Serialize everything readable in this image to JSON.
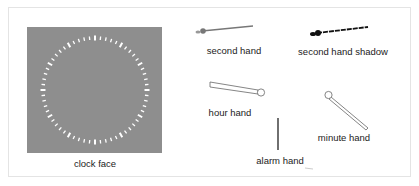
{
  "diagram": {
    "title": "",
    "components": [
      {
        "id": "clock_face",
        "label": "clock face"
      },
      {
        "id": "second_hand",
        "label": "second hand"
      },
      {
        "id": "second_hand_shadow",
        "label": "second hand shadow"
      },
      {
        "id": "hour_hand",
        "label": "hour hand"
      },
      {
        "id": "minute_hand",
        "label": "minute hand"
      },
      {
        "id": "alarm_hand",
        "label": "alarm hand"
      }
    ],
    "clock_face": {
      "tick_count": 60,
      "background": "#8e8e8e",
      "tick_color": "#ffffff"
    },
    "colors": {
      "panel_border": "#e4e4e4",
      "hand_stroke": "#555555",
      "shadow": "#111111",
      "second_hand": "#777777"
    }
  }
}
